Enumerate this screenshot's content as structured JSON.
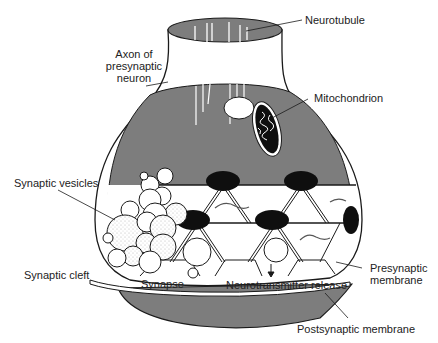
{
  "diagram": {
    "colors": {
      "cytoplasm": "#7d7d7d",
      "outline": "#1a1a1a",
      "dense_body": "#0f0f0f",
      "vesicle": "#ffffff",
      "background": "#ffffff"
    },
    "labels": {
      "neurotubule": "Neurotubule",
      "axon_line1": "Axon of",
      "axon_line2": "presynaptic",
      "axon_line3": "neuron",
      "mitochondrion": "Mitochondrion",
      "synaptic_vesicles": "Synaptic vesicles",
      "synaptic_cleft": "Synaptic cleft",
      "synapse": "Synapse",
      "neurotransmitter_release": "Neurotransmitter release",
      "presynaptic_line1": "Presynaptic",
      "presynaptic_line2": "membrane",
      "postsynaptic_membrane": "Postsynaptic membrane"
    }
  }
}
